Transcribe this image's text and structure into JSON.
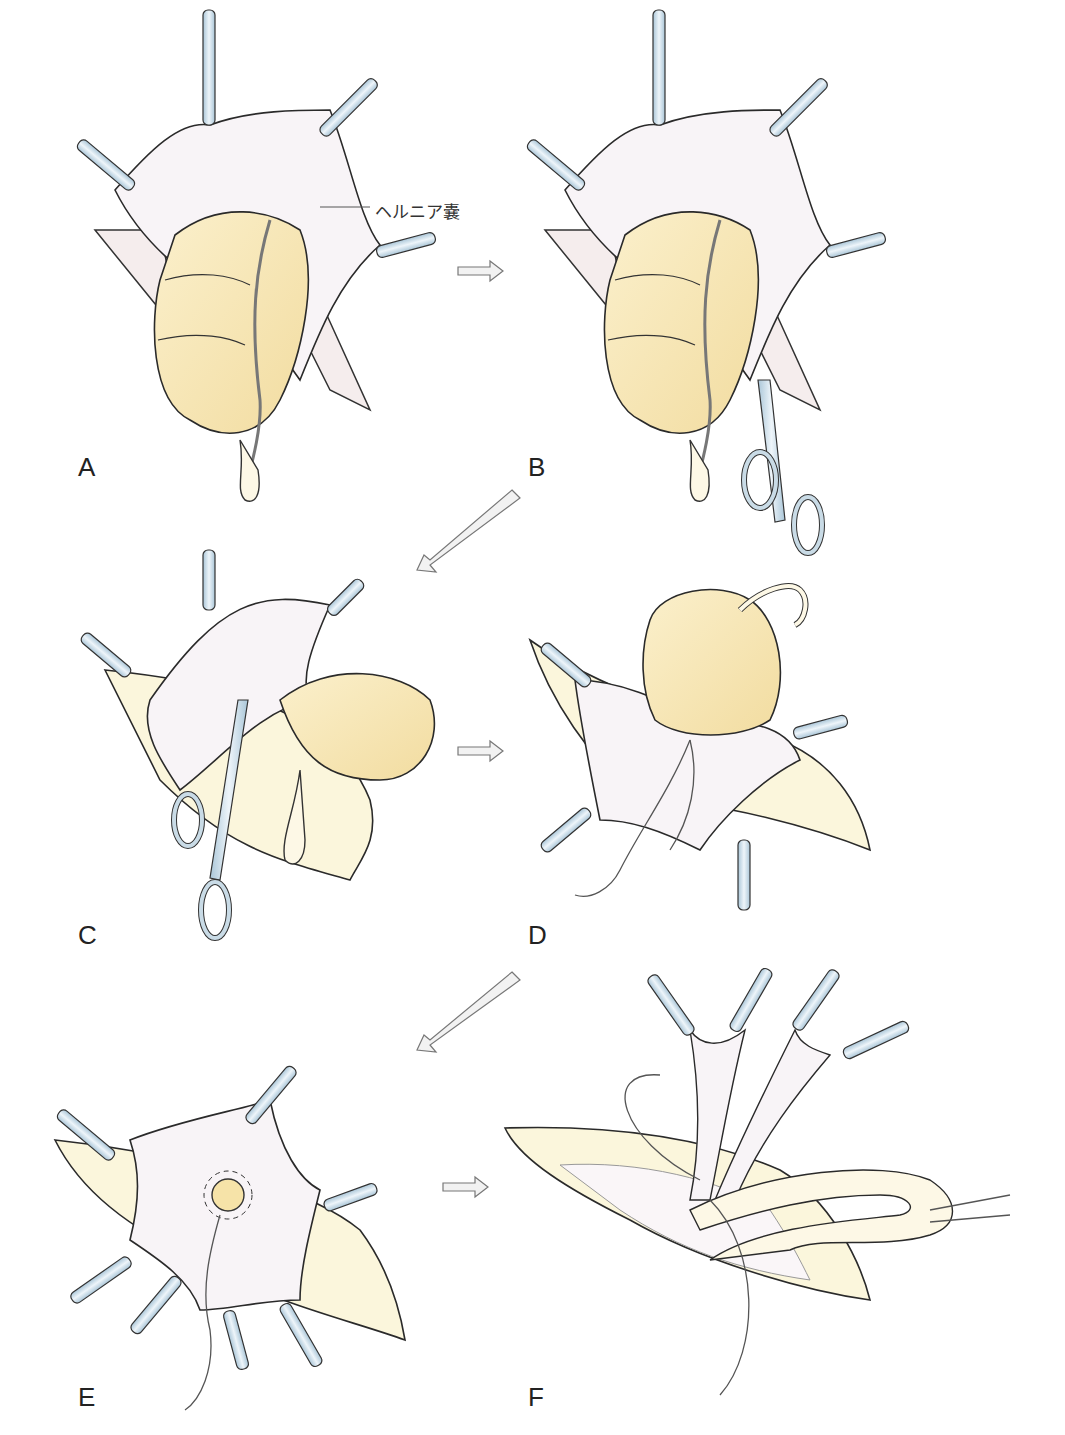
{
  "figure": {
    "annotation": "ヘルニア嚢",
    "panels": [
      {
        "label": "A",
        "x": 78,
        "y": 470
      },
      {
        "label": "B",
        "x": 528,
        "y": 470
      },
      {
        "label": "C",
        "x": 78,
        "y": 940
      },
      {
        "label": "D",
        "x": 528,
        "y": 940
      },
      {
        "label": "E",
        "x": 78,
        "y": 1402
      },
      {
        "label": "F",
        "x": 528,
        "y": 1402
      }
    ],
    "arrows": [
      {
        "from": "A",
        "to": "B",
        "direction": "right"
      },
      {
        "from": "B",
        "to": "C",
        "direction": "down-left"
      },
      {
        "from": "C",
        "to": "D",
        "direction": "right"
      },
      {
        "from": "D",
        "to": "E",
        "direction": "down-left"
      },
      {
        "from": "E",
        "to": "F",
        "direction": "right"
      }
    ],
    "colors": {
      "bowel": "#f6e6b8",
      "sac": "#f7f3f6",
      "instrument": "#c9dbe6",
      "outline": "#2a2a2a",
      "wound": "#fbf6dc"
    }
  }
}
